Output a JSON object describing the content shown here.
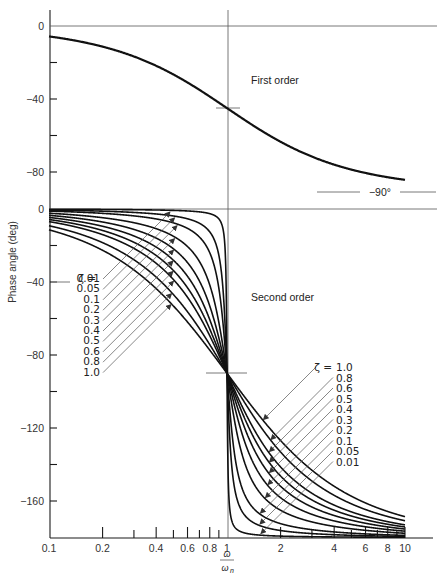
{
  "figure": {
    "ylabel": "Phase angle (deg)",
    "xlabel_num": "ω",
    "xlabel_den": "ω",
    "xlabel_den_sub": "n",
    "first_order_label": "First order",
    "second_order_label": "Second order",
    "minus90_label": "−90°",
    "zeta_prefix": "ζ =",
    "top_yticks": [
      {
        "v": 0,
        "label": "0"
      },
      {
        "v": -40,
        "label": "−40"
      },
      {
        "v": -80,
        "label": "−80"
      }
    ],
    "bottom_yticks": [
      {
        "v": 0,
        "label": "0"
      },
      {
        "v": -40,
        "label": "−40"
      },
      {
        "v": -80,
        "label": "−80"
      },
      {
        "v": -120,
        "label": "−120"
      },
      {
        "v": -160,
        "label": "−160"
      }
    ],
    "xticks": [
      {
        "v": 0.1,
        "label": "0.1"
      },
      {
        "v": 0.2,
        "label": "0.2"
      },
      {
        "v": 0.3,
        "label": ""
      },
      {
        "v": 0.4,
        "label": "0.4"
      },
      {
        "v": 0.5,
        "label": ""
      },
      {
        "v": 0.6,
        "label": "0.6"
      },
      {
        "v": 0.7,
        "label": ""
      },
      {
        "v": 0.8,
        "label": "0.8"
      },
      {
        "v": 0.9,
        "label": ""
      },
      {
        "v": 1,
        "label": "1"
      },
      {
        "v": 2,
        "label": "2"
      },
      {
        "v": 3,
        "label": ""
      },
      {
        "v": 4,
        "label": "4"
      },
      {
        "v": 5,
        "label": ""
      },
      {
        "v": 6,
        "label": "6"
      },
      {
        "v": 7,
        "label": ""
      },
      {
        "v": 8,
        "label": "8"
      },
      {
        "v": 9,
        "label": ""
      },
      {
        "v": 10,
        "label": "10"
      }
    ],
    "left_zeta_labels": [
      "0.01",
      "0.05",
      "0.1",
      "0.2",
      "0.3",
      "0.4",
      "0.5",
      "0.6",
      "0.8",
      "1.0"
    ],
    "right_zeta_labels": [
      "1.0",
      "0.8",
      "0.6",
      "0.5",
      "0.4",
      "0.3",
      "0.2",
      "0.1",
      "0.05",
      "0.01"
    ]
  },
  "chart_data": [
    {
      "type": "line",
      "title": "First order",
      "xlabel": "ω/ωn",
      "ylabel": "Phase angle (deg)",
      "xscale": "log",
      "xlim": [
        0.1,
        10
      ],
      "ylim": [
        -90,
        0
      ],
      "grid": false,
      "annotations": [
        "−90° asymptote",
        "−45° at ω/ωn = 1"
      ],
      "x": [
        0.1,
        0.2,
        0.4,
        0.6,
        0.8,
        1,
        2,
        4,
        6,
        10
      ],
      "series": [
        {
          "name": "First order",
          "values": [
            -5.7,
            -11.3,
            -21.8,
            -31.0,
            -38.7,
            -45.0,
            -63.4,
            -76.0,
            -80.5,
            -84.3
          ]
        }
      ]
    },
    {
      "type": "line",
      "title": "Second order",
      "xlabel": "ω/ωn",
      "ylabel": "Phase angle (deg)",
      "xscale": "log",
      "xlim": [
        0.1,
        10
      ],
      "ylim": [
        -180,
        0
      ],
      "grid": false,
      "legend": "inline ζ labels with leader arrows",
      "annotations": [
        "−90° at ω/ωn = 1 for all ζ"
      ],
      "x": [
        0.1,
        0.2,
        0.4,
        0.6,
        0.8,
        1,
        2,
        4,
        6,
        10
      ],
      "series": [
        {
          "name": "ζ = 0.01",
          "zeta": 0.01,
          "values": [
            -0.1,
            -0.2,
            -0.5,
            -1.1,
            -2.5,
            -90,
            -179.2,
            -179.7,
            -179.8,
            -179.9
          ]
        },
        {
          "name": "ζ = 0.05",
          "zeta": 0.05,
          "values": [
            -0.6,
            -1.2,
            -2.7,
            -5.4,
            -12.5,
            -90,
            -176.2,
            -178.5,
            -179.0,
            -179.4
          ]
        },
        {
          "name": "ζ = 0.1",
          "zeta": 0.1,
          "values": [
            -1.2,
            -2.4,
            -5.4,
            -10.6,
            -24.0,
            -90,
            -172.4,
            -176.9,
            -178.0,
            -178.8
          ]
        },
        {
          "name": "ζ = 0.2",
          "zeta": 0.2,
          "values": [
            -2.3,
            -4.8,
            -10.8,
            -20.6,
            -41.6,
            -90,
            -165.1,
            -173.9,
            -176.1,
            -177.7
          ]
        },
        {
          "name": "ζ = 0.3",
          "zeta": 0.3,
          "values": [
            -3.5,
            -7.1,
            -15.9,
            -29.4,
            -53.1,
            -90,
            -158.2,
            -170.9,
            -174.1,
            -176.5
          ]
        },
        {
          "name": "ζ = 0.4",
          "zeta": 0.4,
          "values": [
            -4.6,
            -9.5,
            -20.9,
            -36.9,
            -60.6,
            -90,
            -151.9,
            -168.0,
            -172.2,
            -175.4
          ]
        },
        {
          "name": "ζ = 0.5",
          "zeta": 0.5,
          "values": [
            -5.8,
            -11.8,
            -25.5,
            -43.2,
            -65.8,
            -90,
            -146.3,
            -165.1,
            -170.3,
            -174.2
          ]
        },
        {
          "name": "ζ = 0.6",
          "zeta": 0.6,
          "values": [
            -6.9,
            -14.0,
            -29.7,
            -48.4,
            -69.4,
            -90,
            -141.3,
            -162.3,
            -168.4,
            -173.1
          ]
        },
        {
          "name": "ζ = 0.8",
          "zeta": 0.8,
          "values": [
            -9.2,
            -18.4,
            -37.3,
            -56.3,
            -74.3,
            -90,
            -133.2,
            -156.9,
            -164.7,
            -170.8
          ]
        },
        {
          "name": "ζ = 1.0",
          "zeta": 1.0,
          "values": [
            -11.4,
            -22.6,
            -43.6,
            -61.9,
            -77.3,
            -90,
            -126.9,
            -151.9,
            -161.1,
            -168.6
          ]
        }
      ]
    }
  ]
}
